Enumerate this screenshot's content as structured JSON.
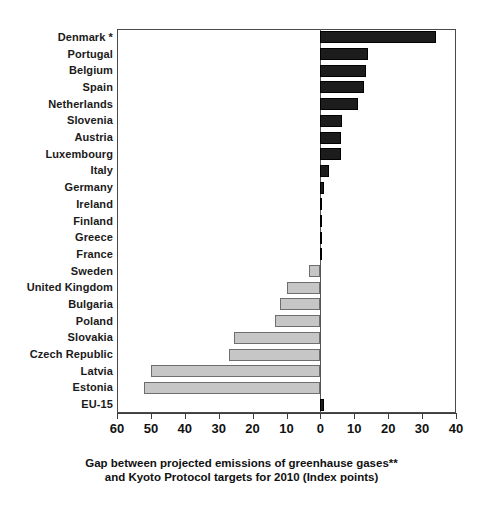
{
  "chart_data": {
    "type": "bar",
    "orientation": "horizontal",
    "title": "",
    "subtitle": "",
    "caption_line1": "Gap between projected emissions of greenhause gases**",
    "caption_line2": "and Kyoto Protocol targets for 2010 (Index points)",
    "xlabel": "",
    "ylabel": "",
    "xlim": [
      -60,
      40
    ],
    "xticks": [
      -60,
      -50,
      -40,
      -30,
      -20,
      -10,
      0,
      10,
      20,
      30,
      40
    ],
    "xtick_labels": [
      "60",
      "50",
      "40",
      "30",
      "20",
      "10",
      "0",
      "10",
      "20",
      "30",
      "40"
    ],
    "grid": false,
    "legend": "none",
    "series_name": "Gap (index points)",
    "colors": {
      "positive": "#1c1c1c",
      "negative": "#c6c6c6",
      "negative_edge": "#6e6e6e",
      "axis": "#3c3c3c",
      "frame": "#4a4a4a",
      "text": "#111111"
    },
    "categories": [
      "Denmark *",
      "Portugal",
      "Belgium",
      "Spain",
      "Netherlands",
      "Slovenia",
      "Austria",
      "Luxembourg",
      "Italy",
      "Germany",
      "Ireland",
      "Finland",
      "Greece",
      "France",
      "Sweden",
      "United Kingdom",
      "Bulgaria",
      "Poland",
      "Slovakia",
      "Czech Republic",
      "Latvia",
      "Estonia",
      "EU-15"
    ],
    "values": [
      34,
      14,
      13.5,
      13,
      11,
      6.5,
      6,
      6,
      2.5,
      1,
      0,
      0,
      0,
      0,
      -3.5,
      -10,
      -12,
      -13.5,
      -25.5,
      -27,
      -50,
      -52,
      1
    ],
    "points": [
      {
        "category": "Denmark *",
        "value": 34
      },
      {
        "category": "Portugal",
        "value": 14
      },
      {
        "category": "Belgium",
        "value": 13.5
      },
      {
        "category": "Spain",
        "value": 13
      },
      {
        "category": "Netherlands",
        "value": 11
      },
      {
        "category": "Slovenia",
        "value": 6.5
      },
      {
        "category": "Austria",
        "value": 6
      },
      {
        "category": "Luxembourg",
        "value": 6
      },
      {
        "category": "Italy",
        "value": 2.5
      },
      {
        "category": "Germany",
        "value": 1
      },
      {
        "category": "Ireland",
        "value": 0
      },
      {
        "category": "Finland",
        "value": 0
      },
      {
        "category": "Greece",
        "value": 0
      },
      {
        "category": "France",
        "value": 0
      },
      {
        "category": "Sweden",
        "value": -3.5
      },
      {
        "category": "United Kingdom",
        "value": -10
      },
      {
        "category": "Bulgaria",
        "value": -12
      },
      {
        "category": "Poland",
        "value": -13.5
      },
      {
        "category": "Slovakia",
        "value": -25.5
      },
      {
        "category": "Czech Republic",
        "value": -27
      },
      {
        "category": "Latvia",
        "value": -50
      },
      {
        "category": "Estonia",
        "value": -52
      },
      {
        "category": "EU-15",
        "value": 1
      }
    ],
    "footnotes": [
      "*",
      "**"
    ]
  }
}
